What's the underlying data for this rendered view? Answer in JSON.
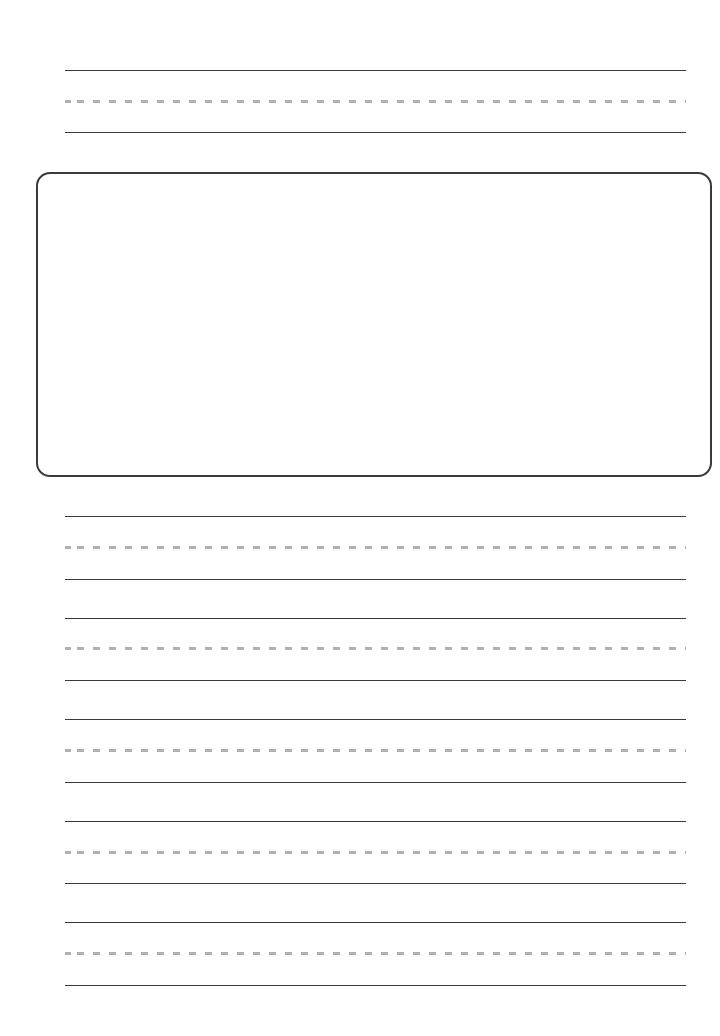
{
  "worksheet": {
    "type": "handwriting-practice",
    "colors": {
      "solid_line": "#3a3a3a",
      "dashed_midline": "#b0b0b0",
      "box_border": "#3a3a3a",
      "background": "#ffffff"
    },
    "top_line_groups": [
      {
        "top": 70,
        "mid": 101,
        "bottom": 132
      }
    ],
    "drawing_box": {
      "left": 36,
      "top": 172,
      "width": 676,
      "height": 305,
      "radius": 14
    },
    "bottom_line_groups": [
      {
        "top": 516,
        "mid": 547,
        "bottom": 579
      },
      {
        "top": 618,
        "mid": 648,
        "bottom": 680
      },
      {
        "top": 719,
        "mid": 750,
        "bottom": 782
      },
      {
        "top": 821,
        "mid": 852,
        "bottom": 883
      },
      {
        "top": 922,
        "mid": 953,
        "bottom": 985
      }
    ]
  }
}
